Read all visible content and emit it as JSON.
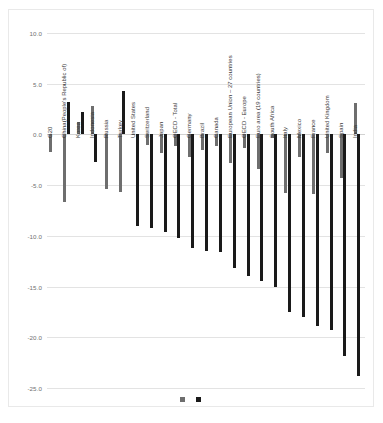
{
  "chart": {
    "title": "",
    "subtitle": "",
    "xlabel": "",
    "ylabel": ""
  },
  "legend": {
    "position": "bottom-center",
    "entries": [
      {
        "label": "",
        "color": "#6e6e6e",
        "name": "series-1"
      },
      {
        "label": "",
        "color": "#1a1a1a",
        "name": "series-2"
      }
    ]
  },
  "axis": {
    "yticks": [
      "10.0",
      "5.0",
      "0.0",
      "-5.0",
      "-10.0",
      "-15.0",
      "-20.0",
      "-25.0"
    ],
    "ytick_values": [
      10,
      5,
      0,
      -5,
      -10,
      -15,
      -20,
      -25
    ],
    "ymin": -25,
    "ymax": 10
  },
  "chart_data": {
    "type": "bar",
    "title": "",
    "xlabel": "",
    "ylabel": "",
    "ylim": [
      -25,
      10
    ],
    "grid": true,
    "legend_position": "bottom-center",
    "categories": [
      "G20",
      "China(People's Republic of)",
      "Korea",
      "Indonesia",
      "Russia",
      "Turkey",
      "United States",
      "Switzerland",
      "Japan",
      "OECD - Total",
      "Germany",
      "Brazil",
      "Canada",
      "European Union – 27 countries",
      "OECD - Europe",
      "Euro area (19 countries)",
      "South Africa",
      "Italy",
      "Mexico",
      "France",
      "United Kingdom",
      "Spain",
      "India"
    ],
    "series": [
      {
        "name": "series-1",
        "color": "#6e6e6e",
        "values": [
          -1.7,
          -6.7,
          1.2,
          2.8,
          -5.4,
          -5.7,
          -0.1,
          -1.0,
          -1.8,
          -1.1,
          -2.2,
          -1.5,
          -1.1,
          -2.8,
          -1.3,
          -3.4,
          -0.4,
          -5.8,
          -2.2,
          -5.9,
          -1.8,
          -4.3,
          3.1
        ]
      },
      {
        "name": "series-2",
        "color": "#1a1a1a",
        "values": [
          0,
          3.2,
          2.2,
          -2.7,
          0,
          4.3,
          -9.0,
          -9.2,
          -9.6,
          -10.2,
          -11.2,
          -11.5,
          -11.6,
          -13.2,
          -14.0,
          -14.5,
          -15.0,
          -17.5,
          -18.0,
          -18.9,
          -19.3,
          -21.8,
          -23.8
        ]
      }
    ]
  }
}
